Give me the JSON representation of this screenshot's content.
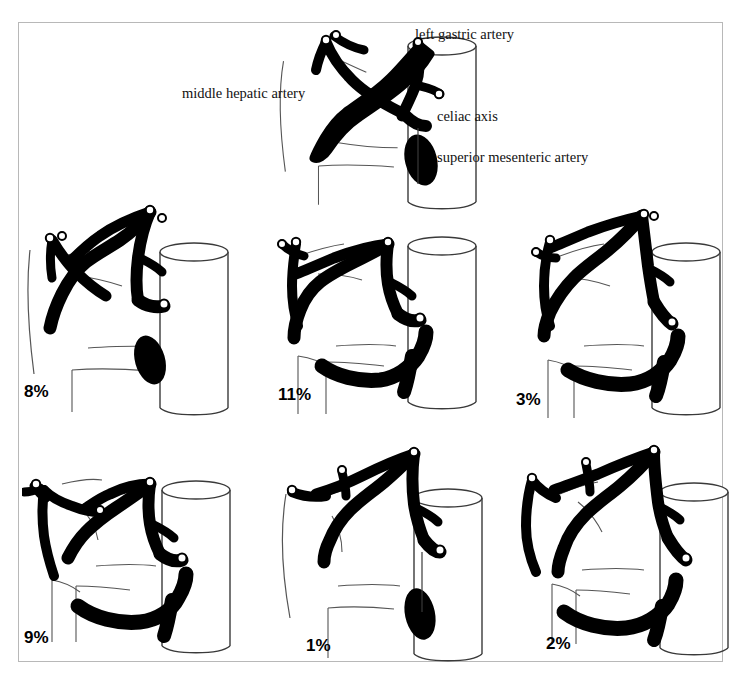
{
  "figure": {
    "background_color": "#ffffff",
    "border_color": "#b8b8b8",
    "vessel_color": "#000000",
    "outline_color": "#3a3a3a"
  },
  "annotations": [
    {
      "id": "left-gastric-artery",
      "text": "left gastric artery",
      "x": 415,
      "y": 26
    },
    {
      "id": "middle-hepatic-artery",
      "text": "middle hepatic artery",
      "x": 182,
      "y": 85
    },
    {
      "id": "celiac-axis",
      "text": "celiac axis",
      "x": 437,
      "y": 108
    },
    {
      "id": "superior-mesenteric-artery",
      "text": "superior mesenteric artery",
      "x": 437,
      "y": 149
    }
  ],
  "panels": [
    {
      "id": "reference",
      "name": "standard-anatomy",
      "percent_label": "",
      "x": 268,
      "y": 24,
      "w": 230,
      "h": 190,
      "variant": "standard"
    },
    {
      "id": "variant-8",
      "name": "variant-replaced-left-hepatic",
      "percent_label": "8%",
      "x": 22,
      "y": 196,
      "w": 230,
      "h": 232,
      "pct_x": 24,
      "pct_y": 382,
      "variant": "a"
    },
    {
      "id": "variant-11",
      "name": "variant-replaced-right-hepatic",
      "percent_label": "11%",
      "x": 262,
      "y": 196,
      "w": 230,
      "h": 232,
      "pct_x": 278,
      "pct_y": 385,
      "variant": "b"
    },
    {
      "id": "variant-3",
      "name": "variant-accessory-both",
      "percent_label": "3%",
      "x": 502,
      "y": 196,
      "w": 230,
      "h": 232,
      "pct_x": 516,
      "pct_y": 390,
      "variant": "c"
    },
    {
      "id": "variant-9",
      "name": "variant-accessory-left-hepatic",
      "percent_label": "9%",
      "x": 22,
      "y": 440,
      "w": 230,
      "h": 232,
      "pct_x": 24,
      "pct_y": 628,
      "variant": "d"
    },
    {
      "id": "variant-1",
      "name": "variant-common-hepatic-from-sma",
      "percent_label": "1%",
      "x": 262,
      "y": 440,
      "w": 230,
      "h": 232,
      "pct_x": 306,
      "pct_y": 636,
      "variant": "e"
    },
    {
      "id": "variant-2",
      "name": "variant-accessory-right-hepatic",
      "percent_label": "2%",
      "x": 502,
      "y": 440,
      "w": 230,
      "h": 232,
      "pct_x": 546,
      "pct_y": 634,
      "variant": "f"
    }
  ],
  "percent_values": [
    {
      "label": "8%",
      "value": 8
    },
    {
      "label": "11%",
      "value": 11
    },
    {
      "label": "3%",
      "value": 3
    },
    {
      "label": "9%",
      "value": 9
    },
    {
      "label": "1%",
      "value": 1
    },
    {
      "label": "2%",
      "value": 2
    }
  ]
}
